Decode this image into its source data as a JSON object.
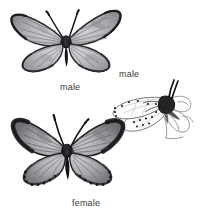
{
  "plate": {
    "kind": "natural-history-illustration",
    "subject": "butterfly",
    "background_color": "#ffffff",
    "label_color": "#3a3a3a",
    "figures": [
      {
        "id": "male-upperside",
        "label": "male",
        "view": "upperside, wings spread",
        "description": "Male butterfly seen from above with wings fully spread; pale grey-blue wing surfaces with fine dark veins, a narrow dark outer border and dark fringe, dark hairy thorax and two long antennae.",
        "wing_fill": "#a9aaae",
        "wing_fill_light": "#c4c5c8",
        "border_color": "#2b2b2d",
        "vein_color": "#6f7075",
        "body_color": "#1f1f21",
        "antenna_color": "#17171a"
      },
      {
        "id": "male-underside",
        "label": "male",
        "view": "underside, wings closed, at rest on plant stem",
        "description": "Male butterfly at rest in side view with wings closed above the body; whitish underside bearing rows of small black spots, perched on an outline-drawn plant stem with leaves.",
        "wing_fill": "#fdfdfd",
        "outline_color": "#6b6b6e",
        "spot_color": "#1a1a1c",
        "body_color": "#232325",
        "plant_color": "#8d8d90"
      },
      {
        "id": "female-upperside",
        "label": "female",
        "view": "upperside, wings spread",
        "description": "Female butterfly seen from above with wings spread; broader and darker smoky wing borders than the male and a row of dark marginal spots along the hindwing edge.",
        "wing_fill": "#9b9ca0",
        "wing_fill_light": "#b9babd",
        "border_color": "#232325",
        "vein_color": "#5f6064",
        "body_color": "#1b1b1d",
        "antenna_color": "#141416",
        "marginal_spots": 11
      }
    ]
  }
}
